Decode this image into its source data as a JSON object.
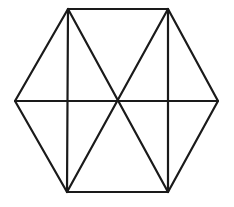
{
  "figure": {
    "kind": "line-drawing",
    "canvas": {
      "width": 234,
      "height": 207,
      "background": "#ffffff"
    },
    "style": {
      "stroke_color": "#1a1a1a",
      "stroke_width": 2.2,
      "fill": "none"
    },
    "vertices": [
      {
        "name": "left",
        "x": 15,
        "y": 101
      },
      {
        "name": "top-left",
        "x": 68,
        "y": 9
      },
      {
        "name": "top-right",
        "x": 168,
        "y": 9
      },
      {
        "name": "right",
        "x": 218,
        "y": 101
      },
      {
        "name": "bottom-right",
        "x": 168,
        "y": 192
      },
      {
        "name": "bottom-left",
        "x": 67,
        "y": 192
      }
    ],
    "center": {
      "name": "center",
      "x": 117,
      "y": 101
    },
    "outline_points": "15,101 68,9 168,9 218,101 168,192 67,192",
    "internal_lines": [
      {
        "name": "horizontal-diameter",
        "x1": 15,
        "y1": 101,
        "x2": 218,
        "y2": 101
      },
      {
        "name": "left-vertical-chord",
        "x1": 68,
        "y1": 9,
        "x2": 67,
        "y2": 192
      },
      {
        "name": "right-vertical-chord",
        "x1": 168,
        "y1": 9,
        "x2": 168,
        "y2": 192
      },
      {
        "name": "diagonal-tl-br",
        "x1": 68,
        "y1": 9,
        "x2": 168,
        "y2": 192
      },
      {
        "name": "diagonal-tr-bl",
        "x1": 168,
        "y1": 9,
        "x2": 67,
        "y2": 192
      }
    ]
  }
}
